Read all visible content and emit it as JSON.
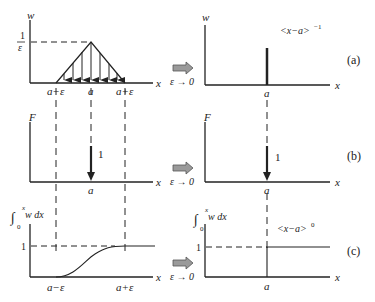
{
  "diagram": {
    "rows": [
      {
        "id": "a",
        "tag": "(a)",
        "left": {
          "y_label": "w",
          "y_tick_num": "1",
          "y_tick_den": "ε",
          "x_label": "x",
          "x_ticks": [
            "a−ε",
            "a",
            "a+ε"
          ],
          "shape": "triangular distributed load, peak 1/ε at a, zero at a−ε and a+ε"
        },
        "transition": {
          "label": "ε → 0"
        },
        "right": {
          "y_label": "w",
          "x_label": "x",
          "x_ticks": [
            "a"
          ],
          "annotation": "<x−a>",
          "annotation_exp": "−1",
          "shape": "impulse spike at a"
        }
      },
      {
        "id": "b",
        "tag": "(b)",
        "left": {
          "y_label": "F",
          "x_label": "x",
          "x_ticks": [
            "a"
          ],
          "force_label": "1",
          "shape": "concentrated downward force of magnitude 1 at a"
        },
        "transition": {
          "label": "ε → 0"
        },
        "right": {
          "y_label": "F",
          "x_label": "x",
          "x_ticks": [
            "a"
          ],
          "force_label": "1",
          "shape": "concentrated downward force of magnitude 1 at a"
        }
      },
      {
        "id": "c",
        "tag": "(c)",
        "left": {
          "y_label_int_upper": "x",
          "y_label_int_lower": "0",
          "y_label_integrand": "w dx",
          "y_tick": "1",
          "x_label": "x",
          "x_ticks": [
            "a−ε",
            "a+ε"
          ],
          "shape": "smooth S-curve rising from 0 at a−ε to 1 at a+ε"
        },
        "transition": {
          "label": "ε → 0"
        },
        "right": {
          "y_label_int_upper": "x",
          "y_label_int_lower": "0",
          "y_label_integrand": "w dx",
          "y_tick": "1",
          "x_label": "x",
          "x_ticks": [
            "a"
          ],
          "annotation": "<x−a>",
          "annotation_exp": "0",
          "shape": "unit step at a"
        }
      }
    ],
    "colors": {
      "line": "#222222",
      "arrow_fill": "#9a9a9a",
      "arrow_stroke": "#555555"
    }
  }
}
